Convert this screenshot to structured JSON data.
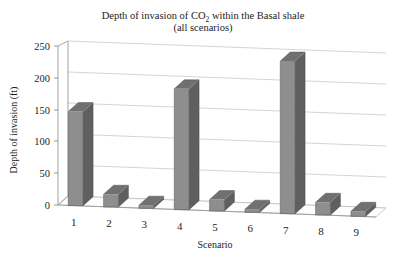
{
  "chart_data": {
    "type": "bar",
    "title": "Depth of invasion of CO2 within the Basal shale",
    "title_line1_pre": "Depth of invasion of CO",
    "title_line1_sub": "2",
    "title_line1_post": " within the Basal shale",
    "title_line2": "(all scenarios)",
    "xlabel": "Scenario",
    "ylabel": "Depth of invasion (ft)",
    "categories": [
      "1",
      "2",
      "3",
      "4",
      "5",
      "6",
      "7",
      "8",
      "9"
    ],
    "values": [
      148,
      20,
      5,
      190,
      18,
      5,
      240,
      20,
      8
    ],
    "ylim": [
      0,
      250
    ],
    "yticks": [
      0,
      50,
      100,
      150,
      200,
      250
    ],
    "ytick_labels": [
      "0",
      "50",
      "100",
      "150",
      "200",
      "250"
    ],
    "grid": true,
    "legend": "none",
    "projection": "3d",
    "series": [
      {
        "name": "Depth of invasion",
        "values": [
          148,
          20,
          5,
          190,
          18,
          5,
          240,
          20,
          8
        ]
      }
    ],
    "colors": {
      "bar_front": "#8e8e8e",
      "bar_side": "#5f5f5f",
      "bar_top": "#707070",
      "gridline": "#c9c9c9",
      "axis": "#9a9a9a",
      "text": "#1c1c1c",
      "background": "#ffffff"
    }
  }
}
